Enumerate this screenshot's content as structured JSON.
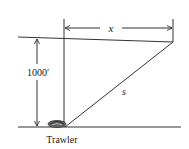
{
  "diagram": {
    "labels": {
      "horizontal_distance": "x",
      "height": "1000′",
      "hypotenuse": "s",
      "boat": "Trawler"
    },
    "colors": {
      "line": "#333333",
      "background": "#ffffff"
    }
  }
}
